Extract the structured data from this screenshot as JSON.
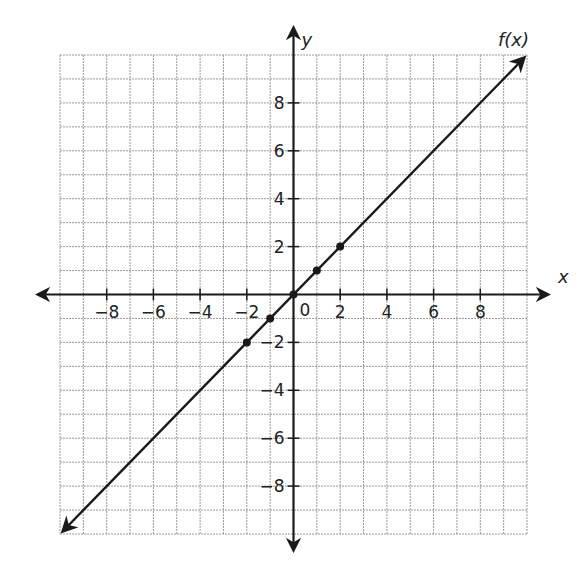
{
  "chart_data": {
    "type": "line",
    "title": "",
    "xlabel": "x",
    "ylabel": "y",
    "xlim": [
      -10,
      10
    ],
    "ylim": [
      -10,
      10
    ],
    "grid": true,
    "grid_step": 1,
    "x_tick_labels": [
      "-8",
      "-6",
      "-4",
      "-2",
      "2",
      "4",
      "6",
      "8"
    ],
    "x_ticks": [
      -8,
      -6,
      -4,
      -2,
      2,
      4,
      6,
      8
    ],
    "y_tick_labels": [
      "8",
      "6",
      "4",
      "2",
      "-2",
      "-4",
      "-6",
      "-8"
    ],
    "y_ticks": [
      8,
      6,
      4,
      2,
      -2,
      -4,
      -6,
      -8
    ],
    "origin_label": "0",
    "series": [
      {
        "name": "f(x)",
        "label": "f(x)",
        "equation": "f(x) = x",
        "slope": 1,
        "intercept": 0,
        "line_from": [
          -10,
          -10
        ],
        "line_to": [
          10,
          10
        ],
        "arrows": "both",
        "points": [
          [
            -2,
            -2
          ],
          [
            -1,
            -1
          ],
          [
            0,
            0
          ],
          [
            1,
            1
          ],
          [
            2,
            2
          ]
        ]
      }
    ]
  },
  "colors": {
    "axis": "#1a1a1a",
    "grid": "#9a9a9a",
    "line": "#1a1a1a",
    "background": "#ffffff"
  },
  "labels": {
    "x_axis": "x",
    "y_axis": "y",
    "function": "f(x)",
    "origin": "0"
  }
}
